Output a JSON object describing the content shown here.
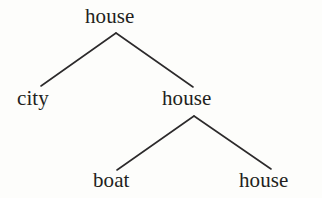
{
  "figure": {
    "kind": "binary-tree-diagram",
    "background_color": "#fdfdfb",
    "edge_color": "#2c2a2b",
    "text_color": "#231f20",
    "edge_width": 1.6
  },
  "tree": {
    "root": {
      "id": "root",
      "label": "house",
      "x": 116,
      "y": 26,
      "children": [
        {
          "id": "left",
          "label": "city",
          "x": 41,
          "y": 96,
          "children": []
        },
        {
          "id": "right",
          "label": "house",
          "x": 193,
          "y": 96,
          "children": [
            {
              "id": "right-left",
              "label": "boat",
              "x": 117,
              "y": 178,
              "children": []
            },
            {
              "id": "right-right",
              "label": "house",
              "x": 271,
              "y": 178,
              "children": []
            }
          ]
        }
      ]
    }
  },
  "nodes": {
    "root": "house",
    "left": "city",
    "right": "house",
    "right_left": "boat",
    "right_right": "house"
  },
  "edges": [
    {
      "id": "edge-root-left",
      "from": "root",
      "to": "left",
      "x1": 116,
      "y1": 33,
      "x2": 41,
      "y2": 86
    },
    {
      "id": "edge-root-right",
      "from": "root",
      "to": "right",
      "x1": 116,
      "y1": 33,
      "x2": 193,
      "y2": 87
    },
    {
      "id": "edge-right-rightleft",
      "from": "right",
      "to": "right_left",
      "x1": 194,
      "y1": 116,
      "x2": 117,
      "y2": 170
    },
    {
      "id": "edge-right-rightright",
      "from": "right",
      "to": "right_right",
      "x1": 194,
      "y1": 116,
      "x2": 271,
      "y2": 169
    }
  ]
}
